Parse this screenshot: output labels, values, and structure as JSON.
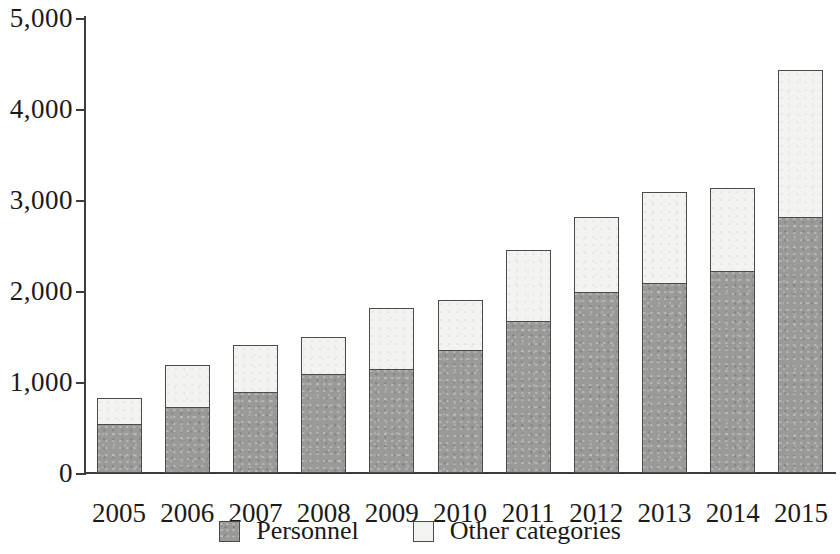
{
  "chart_data": {
    "type": "bar",
    "stacked": true,
    "title": "",
    "subtitle": "",
    "xlabel": "",
    "ylabel": "",
    "ylim": [
      0,
      5000
    ],
    "ytick_interval": 1000,
    "ytick_labels": [
      "5,000",
      "4,000",
      "3,000",
      "2,000",
      "1,000",
      "0"
    ],
    "ytick_values": [
      5000,
      4000,
      3000,
      2000,
      1000,
      0
    ],
    "grid": false,
    "legend_position": "bottom-center",
    "categories": [
      "2005",
      "2006",
      "2007",
      "2008",
      "2009",
      "2010",
      "2011",
      "2012",
      "2013",
      "2014",
      "2015"
    ],
    "series": [
      {
        "name": "Personnel",
        "color": "#9a9b99",
        "values": [
          540,
          730,
          900,
          1090,
          1150,
          1360,
          1680,
          2000,
          2100,
          2230,
          2820
        ]
      },
      {
        "name": "Other categories",
        "color": "#f3f3f1",
        "values": [
          300,
          470,
          520,
          420,
          680,
          560,
          790,
          830,
          1010,
          920,
          1630
        ]
      }
    ],
    "totals": [
      840,
      1200,
      1420,
      1510,
      1830,
      1920,
      2470,
      2830,
      3110,
      3150,
      4450
    ],
    "axis_color": "#3c3c3c",
    "bar_outline_color": "#4a4a4a"
  },
  "legend": {
    "items": [
      {
        "label": "Personnel"
      },
      {
        "label": "Other categories"
      }
    ]
  }
}
